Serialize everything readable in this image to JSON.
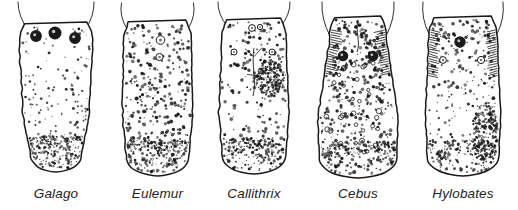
{
  "figure": {
    "kind": "scientific-line-drawing-plate",
    "background_color": "#ffffff",
    "ink_color": "#1a1a1a",
    "label_color": "#232323",
    "width": 518,
    "height": 210
  },
  "specimens": [
    {
      "label": "Galago",
      "index": 1,
      "x": 4,
      "width": 104,
      "body": {
        "top": 22,
        "bottom": 172,
        "half_width_top": 37,
        "half_width_waist": 33,
        "half_width_tip": 20,
        "shape": "tapering-wedge",
        "tip_style": "rounded-narrow"
      },
      "vallate_papillae": [
        {
          "cx": -20,
          "cy": 36,
          "r": 5.2
        },
        {
          "cx": -1,
          "cy": 33,
          "r": 5.8
        },
        {
          "cx": 19,
          "cy": 38,
          "r": 5.2
        }
      ],
      "arches": [
        {
          "x1": -38,
          "y1": 2,
          "x2": -28,
          "y2": 30
        },
        {
          "x1": 38,
          "y1": 2,
          "x2": 29,
          "y2": 30
        }
      ],
      "stipple": {
        "count": 300,
        "dot_min": 0.45,
        "dot_max": 1.5,
        "density_bias": "edges-and-tip"
      },
      "label_y": 186
    },
    {
      "label": "Eulemur",
      "index": 2,
      "x": 110,
      "width": 95,
      "body": {
        "top": 20,
        "bottom": 176,
        "half_width_top": 34,
        "half_width_waist": 35,
        "half_width_tip": 28,
        "shape": "parallel-sided-blunt",
        "tip_style": "broad-square"
      },
      "vallate_papillae": [
        {
          "cx": 3,
          "cy": 40,
          "r": 4.3
        },
        {
          "cx": 2,
          "cy": 57,
          "r": 3.6
        }
      ],
      "arches": [
        {
          "x1": -36,
          "y1": 3,
          "x2": -31,
          "y2": 28
        },
        {
          "x1": 36,
          "y1": 3,
          "x2": 31,
          "y2": 28
        }
      ],
      "stipple": {
        "count": 330,
        "dot_min": 0.5,
        "dot_max": 2.0,
        "density_bias": "uniform"
      },
      "label_y": 186
    },
    {
      "label": "Callithrix",
      "index": 3,
      "x": 204,
      "width": 100,
      "body": {
        "top": 18,
        "bottom": 174,
        "half_width_top": 32,
        "half_width_waist": 35,
        "half_width_tip": 30,
        "shape": "ovoid",
        "tip_style": "rounded-broad"
      },
      "vallate_papillae": [
        {
          "cx": -2,
          "cy": 28,
          "r": 3.4
        },
        {
          "cx": 6,
          "cy": 27,
          "r": 2.6
        },
        {
          "cx": -20,
          "cy": 52,
          "r": 3.0
        },
        {
          "cx": 18,
          "cy": 52,
          "r": 3.0
        }
      ],
      "arches": [
        {
          "x1": -36,
          "y1": 2,
          "x2": -27,
          "y2": 26
        },
        {
          "x1": 36,
          "y1": 2,
          "x2": 27,
          "y2": 26
        }
      ],
      "median_sulcus": {
        "x": 0,
        "y_top": 48,
        "y_bottom": 96,
        "branched": true
      },
      "dark_patch": {
        "cx": 16,
        "cy": 78,
        "rx": 14,
        "ry": 19
      },
      "stipple": {
        "count": 300,
        "dot_min": 0.5,
        "dot_max": 1.9,
        "density_bias": "right-heavy"
      },
      "label_y": 186
    },
    {
      "label": "Cebus",
      "index": 4,
      "x": 308,
      "width": 100,
      "body": {
        "top": 16,
        "bottom": 178,
        "half_width_top": 28,
        "half_width_waist": 40,
        "half_width_tip": 38,
        "shape": "narrow-root-broad-blade",
        "tip_style": "broad-round"
      },
      "vallate_papillae": [
        {
          "cx": -15,
          "cy": 56,
          "r": 4.6
        },
        {
          "cx": 15,
          "cy": 56,
          "r": 4.6
        }
      ],
      "arches": [
        {
          "x1": -36,
          "y1": 2,
          "x2": -28,
          "y2": 36
        },
        {
          "x1": 36,
          "y1": 2,
          "x2": 28,
          "y2": 36
        }
      ],
      "median_sulcus": {
        "x": 0,
        "y_top": 20,
        "y_bottom": 52,
        "branched": false
      },
      "lateral_folds": true,
      "fungiform_rings": 34,
      "stipple": {
        "count": 380,
        "dot_min": 0.5,
        "dot_max": 2.0,
        "density_bias": "uniform"
      },
      "label_y": 186
    },
    {
      "label": "Hylobates",
      "index": 5,
      "x": 412,
      "width": 102,
      "body": {
        "top": 16,
        "bottom": 176,
        "half_width_top": 34,
        "half_width_waist": 38,
        "half_width_tip": 34,
        "shape": "broad-parallel",
        "tip_style": "broad-square"
      },
      "vallate_papillae": [
        {
          "cx": -3,
          "cy": 42,
          "r": 5.0
        },
        {
          "cx": -20,
          "cy": 60,
          "r": 3.4
        },
        {
          "cx": 18,
          "cy": 60,
          "r": 3.6
        }
      ],
      "arches": [
        {
          "x1": -40,
          "y1": 2,
          "x2": -34,
          "y2": 34
        },
        {
          "x1": 40,
          "y1": 2,
          "x2": 34,
          "y2": 34
        }
      ],
      "lateral_folds": true,
      "dark_patch": {
        "cx": 22,
        "cy": 132,
        "rx": 13,
        "ry": 30
      },
      "stipple": {
        "count": 360,
        "dot_min": 0.5,
        "dot_max": 1.9,
        "density_bias": "top-and-right"
      },
      "label_y": 186
    }
  ]
}
